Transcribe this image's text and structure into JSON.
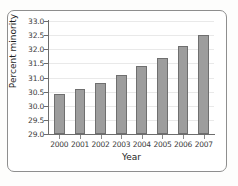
{
  "chart_data": {
    "type": "bar",
    "title": "",
    "xlabel": "Year",
    "ylabel": "Percent minority",
    "categories": [
      "2000",
      "2001",
      "2002",
      "2003",
      "2004",
      "2005",
      "2006",
      "2007"
    ],
    "values": [
      30.4,
      30.6,
      30.8,
      31.1,
      31.4,
      31.7,
      32.1,
      32.5
    ],
    "ylim": [
      29.0,
      33.0
    ],
    "y_ticks": [
      "29.0",
      "29.5",
      "30.0",
      "30.5",
      "31.0",
      "31.5",
      "32.0",
      "32.5",
      "33.0"
    ],
    "y_tick_values": [
      29.0,
      29.5,
      30.0,
      30.5,
      31.0,
      31.5,
      32.0,
      32.5,
      33.0
    ],
    "grid": true,
    "legend": null,
    "bar_color": "#9d9d9d",
    "bar_edge_color": "#6f6f6f",
    "axis_color": "#6d6d6d",
    "grid_color": "#e9e9e9"
  }
}
